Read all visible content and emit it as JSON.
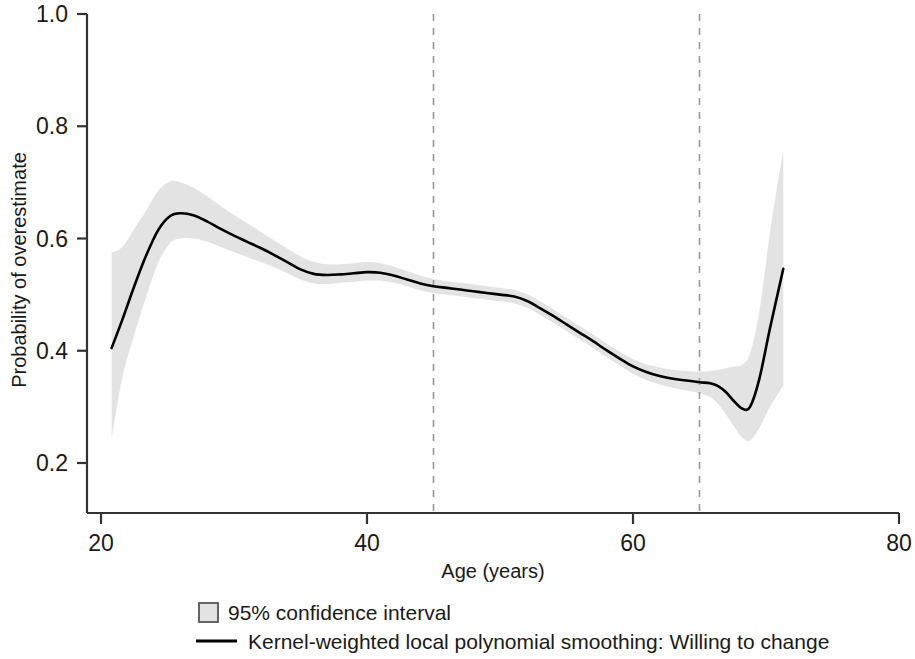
{
  "chart_data": {
    "type": "line",
    "title": "",
    "xlabel": "Age (years)",
    "ylabel": "Probability of overestimate",
    "xlim": [
      20,
      80
    ],
    "ylim": [
      0.2,
      1.0
    ],
    "xticks": [
      20,
      40,
      60,
      80
    ],
    "xtick_labels": [
      "20",
      "40",
      "60",
      "80"
    ],
    "yticks": [
      0.2,
      0.4,
      0.6,
      0.8,
      1.0
    ],
    "ytick_labels": [
      "0.2",
      "0.4",
      "0.6",
      "0.8",
      "1.0"
    ],
    "grid": false,
    "legend_position": "below-axes-left",
    "annotations": {
      "vlines": [
        {
          "name": "reference-line-45",
          "x": 45,
          "style": "dashed",
          "color": "#9a9a9a"
        },
        {
          "name": "reference-line-65",
          "x": 65,
          "style": "dashed",
          "color": "#9a9a9a"
        }
      ]
    },
    "series": [
      {
        "name": "Kernel-weighted local polynomial smoothing: Willing to change",
        "type": "line",
        "color": "#000000",
        "x": [
          20.8,
          21.6,
          22.5,
          23.4,
          24.3,
          25.2,
          26.0,
          27.0,
          28.0,
          29.0,
          30.0,
          31.0,
          32.0,
          33.0,
          34.0,
          35.0,
          36.0,
          37.0,
          38.0,
          39.0,
          40.0,
          41.0,
          42.0,
          43.0,
          44.0,
          45.0,
          46.0,
          47.0,
          48.0,
          49.0,
          50.0,
          51.0,
          52.0,
          53.0,
          54.0,
          55.0,
          56.0,
          57.0,
          58.0,
          59.0,
          60.0,
          61.0,
          62.0,
          63.0,
          64.0,
          65.0,
          65.8,
          66.4,
          67.0,
          67.6,
          68.2,
          68.8,
          69.5,
          70.3,
          71.3
        ],
        "y": [
          0.405,
          0.455,
          0.515,
          0.57,
          0.615,
          0.64,
          0.645,
          0.641,
          0.63,
          0.617,
          0.605,
          0.594,
          0.583,
          0.571,
          0.558,
          0.545,
          0.537,
          0.535,
          0.536,
          0.538,
          0.54,
          0.539,
          0.534,
          0.527,
          0.52,
          0.515,
          0.512,
          0.509,
          0.506,
          0.503,
          0.5,
          0.497,
          0.489,
          0.476,
          0.462,
          0.447,
          0.432,
          0.417,
          0.401,
          0.386,
          0.372,
          0.362,
          0.355,
          0.35,
          0.347,
          0.344,
          0.342,
          0.337,
          0.326,
          0.31,
          0.297,
          0.3,
          0.35,
          0.44,
          0.546
        ]
      },
      {
        "name": "95% confidence interval",
        "type": "band",
        "color": "#e3e3e3",
        "x": [
          20.8,
          21.6,
          22.5,
          23.4,
          24.3,
          25.2,
          26.0,
          27.0,
          28.0,
          29.0,
          30.0,
          31.0,
          32.0,
          33.0,
          34.0,
          35.0,
          36.0,
          37.0,
          38.0,
          39.0,
          40.0,
          41.0,
          42.0,
          43.0,
          44.0,
          45.0,
          46.0,
          47.0,
          48.0,
          49.0,
          50.0,
          51.0,
          52.0,
          53.0,
          54.0,
          55.0,
          56.0,
          57.0,
          58.0,
          59.0,
          60.0,
          61.0,
          62.0,
          63.0,
          64.0,
          65.0,
          65.8,
          66.4,
          67.0,
          67.6,
          68.2,
          68.8,
          69.5,
          70.3,
          71.3
        ],
        "y_lower": [
          0.243,
          0.352,
          0.428,
          0.497,
          0.557,
          0.592,
          0.6,
          0.6,
          0.594,
          0.585,
          0.576,
          0.567,
          0.558,
          0.549,
          0.538,
          0.527,
          0.52,
          0.519,
          0.521,
          0.523,
          0.525,
          0.525,
          0.521,
          0.515,
          0.508,
          0.503,
          0.5,
          0.497,
          0.494,
          0.491,
          0.488,
          0.485,
          0.477,
          0.464,
          0.45,
          0.435,
          0.42,
          0.405,
          0.389,
          0.374,
          0.359,
          0.348,
          0.34,
          0.334,
          0.329,
          0.324,
          0.318,
          0.305,
          0.286,
          0.265,
          0.245,
          0.24,
          0.262,
          0.3,
          0.338
        ],
        "y_upper": [
          0.575,
          0.585,
          0.617,
          0.65,
          0.685,
          0.702,
          0.7,
          0.69,
          0.675,
          0.658,
          0.642,
          0.627,
          0.612,
          0.597,
          0.582,
          0.568,
          0.558,
          0.554,
          0.554,
          0.556,
          0.558,
          0.556,
          0.55,
          0.542,
          0.534,
          0.528,
          0.524,
          0.521,
          0.518,
          0.515,
          0.512,
          0.509,
          0.501,
          0.488,
          0.474,
          0.459,
          0.444,
          0.429,
          0.413,
          0.398,
          0.385,
          0.376,
          0.37,
          0.366,
          0.364,
          0.363,
          0.364,
          0.366,
          0.369,
          0.372,
          0.375,
          0.395,
          0.47,
          0.61,
          0.758
        ]
      }
    ],
    "legend": [
      {
        "label": "95% confidence interval",
        "marker": "square-swatch",
        "color": "#e3e3e3"
      },
      {
        "label": "Kernel-weighted local polynomial smoothing: Willing to change",
        "marker": "line",
        "color": "#000000"
      }
    ]
  },
  "axes": {
    "y_title": "Probability of overestimate",
    "x_title": "Age (years)"
  },
  "colors": {
    "line": "#000000",
    "band": "#e3e3e3",
    "axis": "#333333",
    "refline": "#9a9a9a"
  }
}
